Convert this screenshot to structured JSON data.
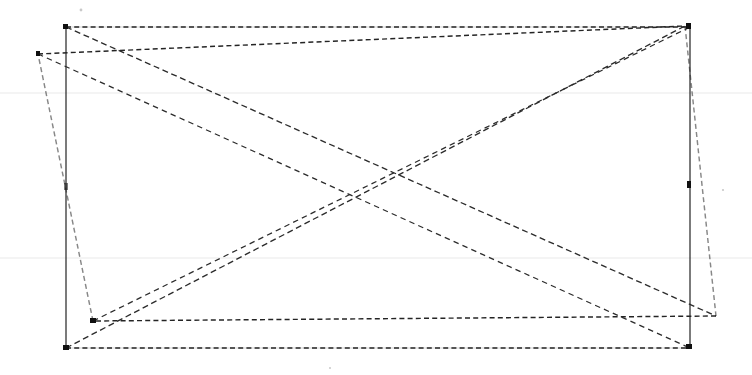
{
  "document": {
    "title": "Scanned line drawing",
    "kind": "fax-scan-line-art",
    "background_color": "#ffffff",
    "ink_color": "#1a1a1a",
    "canvas": {
      "width": 752,
      "height": 375
    }
  },
  "figure": {
    "solid_quad": {
      "name": "solid-rectangle",
      "stroke_color": "#1a1a1a",
      "style": "solid",
      "points": "66,27 690,27 690,348 66,348",
      "corners": [
        {
          "label": "top-left",
          "x": 66,
          "y": 27
        },
        {
          "label": "top-right",
          "x": 690,
          "y": 27
        },
        {
          "label": "bottom-right",
          "x": 690,
          "y": 348
        },
        {
          "label": "bottom-left",
          "x": 66,
          "y": 348
        }
      ]
    },
    "dashed_quad": {
      "name": "dashed-rectangle",
      "stroke_color": "#242424",
      "style": "dashed",
      "points": "38,54 685,26 716,316 93,321",
      "corners": [
        {
          "label": "top-left",
          "x": 38,
          "y": 54
        },
        {
          "label": "top-right",
          "x": 685,
          "y": 26
        },
        {
          "label": "bottom-right",
          "x": 716,
          "y": 316
        },
        {
          "label": "bottom-left",
          "x": 93,
          "y": 321
        }
      ]
    },
    "diagonals": [
      {
        "name": "diagonal-a",
        "from_x": 66,
        "from_y": 27,
        "to_x": 716,
        "to_y": 316,
        "style": "dashed"
      },
      {
        "name": "diagonal-b",
        "from_x": 38,
        "from_y": 54,
        "to_x": 690,
        "to_y": 348,
        "style": "dashed"
      },
      {
        "name": "diagonal-c",
        "from_x": 66,
        "from_y": 348,
        "to_x": 685,
        "to_y": 26,
        "style": "dashed"
      },
      {
        "name": "diagonal-d",
        "from_x": 93,
        "from_y": 321,
        "to_x": 690,
        "to_y": 27,
        "style": "dashed"
      }
    ],
    "crossing_point": {
      "x": 376,
      "y": 188
    },
    "scan_artifacts": [
      {
        "name": "hairline-upper",
        "y": 93,
        "color": "#e9e9e9"
      },
      {
        "name": "hairline-lower",
        "y": 258,
        "color": "#e9e9e9"
      }
    ],
    "corner_marks": [
      {
        "name": "mark-top-left",
        "x": 66,
        "y": 27
      },
      {
        "name": "mark-top-right",
        "x": 690,
        "y": 27
      },
      {
        "name": "mark-bottom-left",
        "x": 66,
        "y": 348
      },
      {
        "name": "mark-bottom-right",
        "x": 690,
        "y": 348
      },
      {
        "name": "mark-dashed-bottom-left",
        "x": 93,
        "y": 321
      },
      {
        "name": "mark-dashed-top-right",
        "x": 685,
        "y": 26
      }
    ],
    "speckles": [
      {
        "x": 81,
        "y": 10,
        "r": 1.4
      },
      {
        "x": 723,
        "y": 190,
        "r": 1.1
      },
      {
        "x": 330,
        "y": 368,
        "r": 1.0
      }
    ]
  }
}
